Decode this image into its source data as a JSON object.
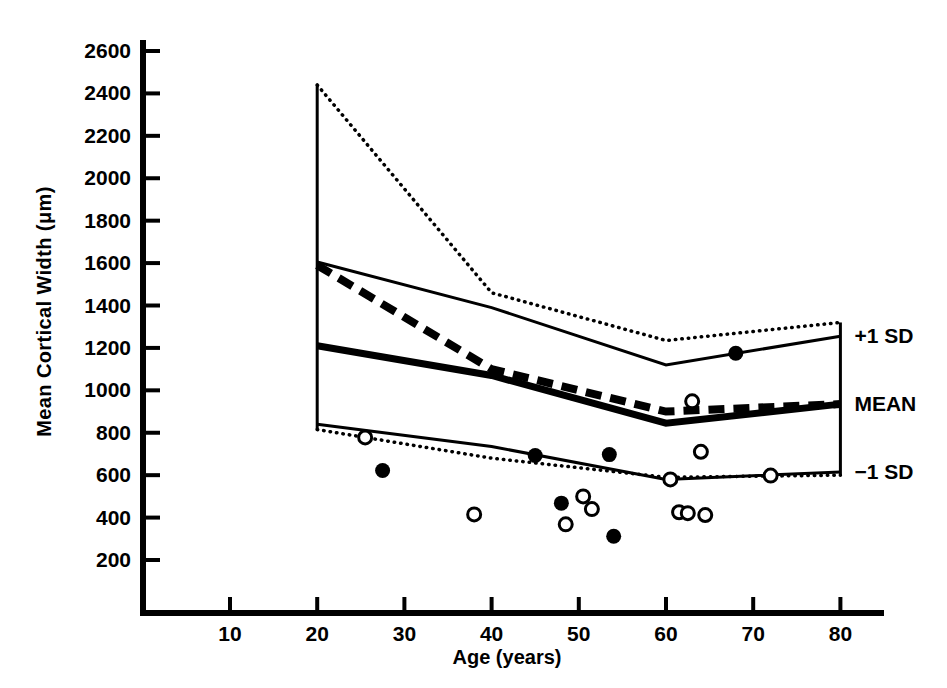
{
  "chart_data": {
    "type": "line",
    "title": "",
    "xlabel": "Age (years)",
    "ylabel": "Mean Cortical Width (μm)",
    "xlim": [
      0,
      85
    ],
    "ylim": [
      0,
      2700
    ],
    "grid": false,
    "legend_position": "right-inline",
    "xticks": [
      10,
      20,
      30,
      40,
      50,
      60,
      70,
      80
    ],
    "yticks": [
      200,
      400,
      600,
      800,
      1000,
      1200,
      1400,
      1600,
      1800,
      2000,
      2200,
      2400,
      2600
    ],
    "annotations": [
      {
        "text": "+1 SD",
        "x": 80,
        "y": 1255
      },
      {
        "text": "MEAN",
        "x": 80,
        "y": 935
      },
      {
        "text": "−1 SD",
        "x": 80,
        "y": 615
      }
    ],
    "series": [
      {
        "name": "+1 SD (reference, dotted)",
        "style": "dotted",
        "color": "#000000",
        "x": [
          20,
          40,
          60,
          80
        ],
        "values": [
          2440,
          1460,
          1235,
          1320
        ]
      },
      {
        "name": "+1 SD (study, thin solid)",
        "style": "solid-thin",
        "color": "#000000",
        "x": [
          20,
          40,
          60,
          80
        ],
        "values": [
          1605,
          1390,
          1120,
          1255
        ]
      },
      {
        "name": "MEAN (study, thick solid)",
        "style": "solid-thick",
        "color": "#000000",
        "x": [
          20,
          40,
          60,
          80
        ],
        "values": [
          1210,
          1070,
          845,
          935
        ]
      },
      {
        "name": "MEAN (reference, dashed)",
        "style": "dashed",
        "color": "#000000",
        "x": [
          20,
          40,
          60,
          80
        ],
        "values": [
          1590,
          1100,
          900,
          935
        ]
      },
      {
        "name": "−1 SD (study, thin solid)",
        "style": "solid-thin",
        "color": "#000000",
        "x": [
          20,
          40,
          60,
          80
        ],
        "values": [
          840,
          735,
          580,
          615
        ]
      },
      {
        "name": "−1 SD (reference, dotted)",
        "style": "dotted",
        "color": "#000000",
        "x": [
          20,
          40,
          60,
          80
        ],
        "values": [
          815,
          680,
          590,
          600
        ]
      }
    ],
    "scatter": [
      {
        "name": "Filled circles",
        "marker": "filled-circle",
        "color": "#000000",
        "points": [
          {
            "x": 27.5,
            "y": 622
          },
          {
            "x": 45,
            "y": 693
          },
          {
            "x": 48,
            "y": 468
          },
          {
            "x": 53.5,
            "y": 697
          },
          {
            "x": 54,
            "y": 312
          },
          {
            "x": 68,
            "y": 1175
          }
        ]
      },
      {
        "name": "Open circles",
        "marker": "open-circle",
        "color": "#000000",
        "points": [
          {
            "x": 25.5,
            "y": 778
          },
          {
            "x": 38,
            "y": 415
          },
          {
            "x": 48.5,
            "y": 368
          },
          {
            "x": 50.5,
            "y": 500
          },
          {
            "x": 51.5,
            "y": 440
          },
          {
            "x": 61.5,
            "y": 425
          },
          {
            "x": 62.5,
            "y": 421
          },
          {
            "x": 63,
            "y": 948
          },
          {
            "x": 60.5,
            "y": 580
          },
          {
            "x": 64.5,
            "y": 412
          },
          {
            "x": 64,
            "y": 710
          },
          {
            "x": 72,
            "y": 598
          }
        ]
      }
    ]
  },
  "axes": {
    "y_tick_labels": [
      "2600",
      "2400",
      "2200",
      "2000",
      "1800",
      "1600",
      "1400",
      "1200",
      "1000",
      "800",
      "600",
      "400",
      "200"
    ],
    "x_tick_labels": [
      "10",
      "20",
      "30",
      "40",
      "50",
      "60",
      "70",
      "80"
    ],
    "y_title": "Mean Cortical Width (μm)",
    "x_title": "Age (years)"
  },
  "side_labels": {
    "plus_one_sd": "+1 SD",
    "mean": "MEAN",
    "minus_one_sd": "−1 SD"
  },
  "colors": {
    "ink": "#000000",
    "background": "#ffffff"
  }
}
